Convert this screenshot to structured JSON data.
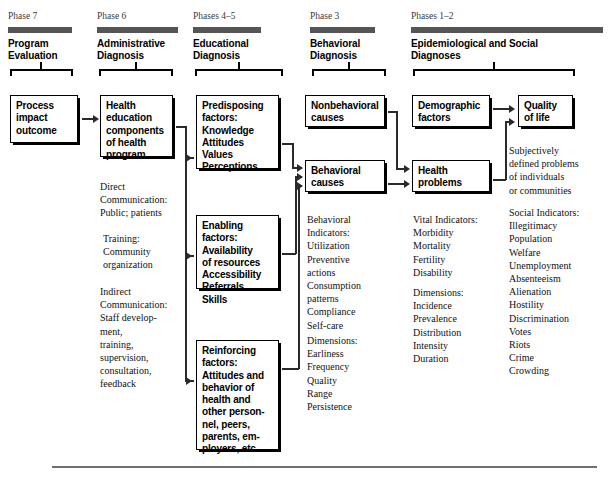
{
  "diagram": {
    "bar_color": "#555555",
    "line_color": "#2a2a2a"
  },
  "columns": [
    {
      "phase_label": "Phase 7",
      "phase_title": "Program\nEvaluation"
    },
    {
      "phase_label": "Phase 6",
      "phase_title": "Administrative\nDiagnosis"
    },
    {
      "phase_label": "Phases 4–5",
      "phase_title": "Educational\nDiagnosis"
    },
    {
      "phase_label": "Phase 3",
      "phase_title": "Behavioral\nDiagnosis"
    },
    {
      "phase_label": "Phases 1–2",
      "phase_title": "Epidemiological and Social\nDiagnoses"
    }
  ],
  "boxes": {
    "process_impact_outcome": "Process\nimpact\noutcome",
    "health_education_components": "Health\neducation\ncomponents\nof health\nprogram",
    "predisposing_factors": "Predisposing\nfactors:\n    Knowledge\n    Attitudes\n    Values\n    Perceptions",
    "enabling_factors": "Enabling\nfactors:\n    Availability\n    of resources\n    Accessibility\n    Referrals\n    Skills",
    "reinforcing_factors": "Reinforcing\nfactors:\n    Attitudes and\n    behavior of\n    health and\n    other person-\n    nel, peers,\n    parents, em-\n    ployers, etc.",
    "nonbehavioral_causes": "Nonbehavioral\ncauses",
    "behavioral_causes": "Behavioral\ncauses",
    "demographic_factors": "Demographic\nfactors",
    "health_problems": "Health\nproblems",
    "quality_of_life": "Quality\nof life"
  },
  "notes": {
    "direct_communication": "Direct\nCommunication:\n   Public; patients",
    "training": "Training:\n   Community\n   organization",
    "indirect_communication": "Indirect\nCommunication:\n   Staff develop-\n   ment,\n   training,\n   supervision,\n   consultation,\n   feedback",
    "behavioral_indicators": "Behavioral\nIndicators:\n   Utilization\n   Preventive\n      actions\n   Consumption\n      patterns\n   Compliance\n   Self-care",
    "behavioral_dimensions": "Dimensions:\n   Earliness\n   Frequency\n   Quality\n   Range\n   Persistence",
    "vital_indicators": "Vital Indicators:\n   Morbidity\n   Mortality\n   Fertility\n   Disability",
    "health_dimensions": "Dimensions:\n   Incidence\n   Prevalence\n   Distribution\n   Intensity\n   Duration",
    "subjectively_defined": "Subjectively\ndefined problems\nof individuals\nor communities",
    "social_indicators": "Social Indicators:\n   Illegitimacy\n   Population\n   Welfare\n   Unemployment\n   Absenteeism\n   Alienation\n   Hostility\n   Discrimination\n   Votes\n   Riots\n   Crime\n   Crowding"
  }
}
